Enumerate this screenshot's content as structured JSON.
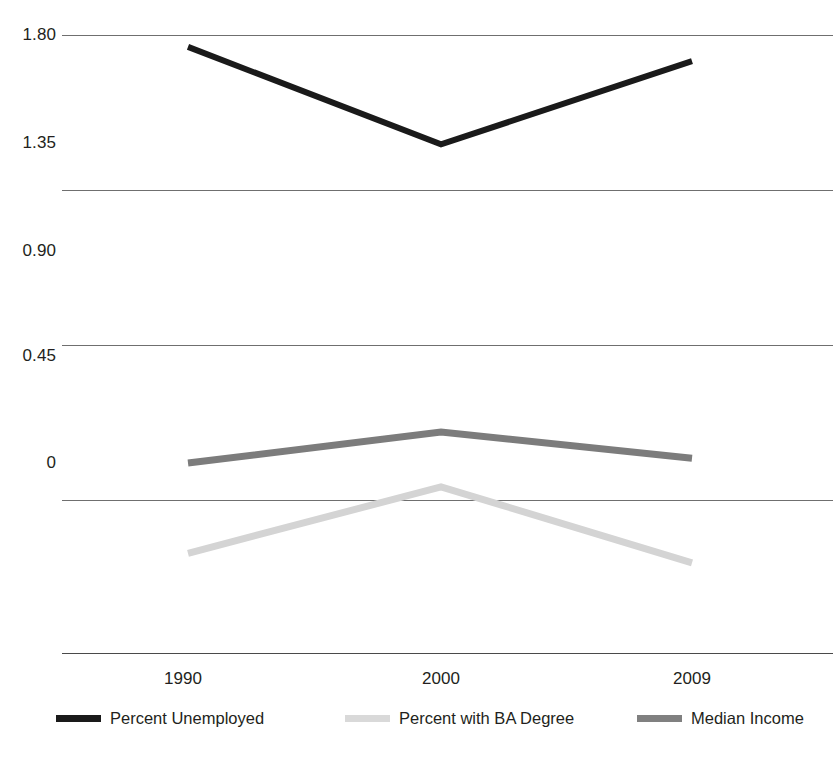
{
  "chart_data": {
    "type": "line",
    "title": "",
    "subtitle": "",
    "xlabel": "",
    "ylabel": "",
    "categories": [
      "1990",
      "2000",
      "2009"
    ],
    "x_tick_labels": [
      "1990",
      "2000",
      "2009"
    ],
    "y_tick_labels": [
      "1.80",
      "1.35",
      "0.90",
      "0.45",
      "0"
    ],
    "y_tick_values": [
      1.8,
      1.35,
      0.9,
      0.45,
      0
    ],
    "ylim": [
      -0.55,
      1.95
    ],
    "grid": "horizontal",
    "legend_position": "bottom",
    "series": [
      {
        "name": "Percent Unemployed",
        "color": "#1a1a1a",
        "width": 6,
        "values": [
          1.75,
          1.34,
          1.69
        ]
      },
      {
        "name": "Percent with BA Degree",
        "color": "#d4d4d4",
        "width": 7,
        "values": [
          -0.38,
          -0.1,
          -0.42
        ]
      },
      {
        "name": "Median Income",
        "color": "#7c7c7c",
        "width": 7,
        "values": [
          0.0,
          0.13,
          0.02
        ]
      }
    ],
    "annotations": []
  },
  "axes": {
    "y_ticks": [
      {
        "label": "1.80",
        "top": 35
      },
      {
        "label": "1.35",
        "top": 143
      },
      {
        "label": "0.90",
        "top": 251
      },
      {
        "label": "0.45",
        "top": 356
      },
      {
        "label": "0",
        "top": 463
      }
    ],
    "gridlines": [
      35,
      190,
      345,
      500
    ],
    "baseline": 653,
    "x_ticks": [
      {
        "label": "1990",
        "left": 183
      },
      {
        "label": "2000",
        "left": 441
      },
      {
        "label": "2009",
        "left": 692
      }
    ]
  },
  "legend": {
    "entries": [
      {
        "label": "Percent Unemployed",
        "color": "#1a1a1a",
        "left": 56,
        "thickness": 7
      },
      {
        "label": "Percent with BA Degree",
        "color": "#d9d9d9",
        "left": 345,
        "thickness": 7
      },
      {
        "label": "Median Income",
        "color": "#808080",
        "left": 637,
        "thickness": 7
      }
    ]
  },
  "colors": {
    "background": "#ffffff",
    "gridline": "#6f6f6f",
    "axis": "#4a4a4a",
    "text": "#231f20",
    "series_unemployed": "#1a1a1a",
    "series_ba_degree": "#d4d4d4",
    "series_median_income": "#7c7c7c"
  }
}
